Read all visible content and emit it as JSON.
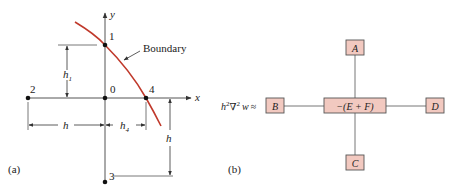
{
  "colors": {
    "axis": "#555555",
    "boundary_curve": "#c0392b",
    "node_fill": "#f2c9c0",
    "node_stroke": "#555555",
    "connector": "#777777",
    "text": "#222222"
  },
  "panel_a": {
    "caption": "(a)",
    "axes": {
      "x_label": "x",
      "y_label": "y"
    },
    "boundary_label": "Boundary",
    "points": [
      {
        "id": "0",
        "label": "0"
      },
      {
        "id": "1",
        "label": "1"
      },
      {
        "id": "2",
        "label": "2"
      },
      {
        "id": "3",
        "label": "3"
      },
      {
        "id": "4",
        "label": "4"
      }
    ],
    "dimensions": {
      "h1": "h",
      "h1_sub": "1",
      "h_left": "h",
      "h4": "h",
      "h4_sub": "4",
      "h_right": "h"
    }
  },
  "panel_b": {
    "caption": "(b)",
    "equation_lhs": {
      "h": "h",
      "h_exp": "2",
      "nabla": "∇",
      "nabla_exp": "2",
      "w": "w",
      "approx": "≈"
    },
    "stencil": {
      "top": "A",
      "left": "B",
      "center": "−(E + F)",
      "right": "D",
      "bottom": "C"
    }
  }
}
